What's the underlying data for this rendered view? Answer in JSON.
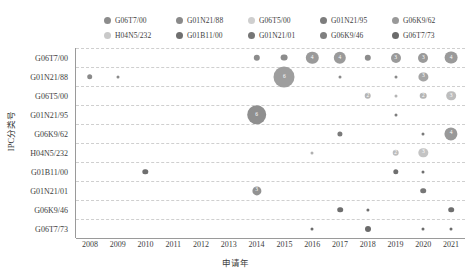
{
  "chart_data": {
    "type": "scatter",
    "title": "",
    "xlabel": "申请年",
    "ylabel": "IPC分类号",
    "x_categories": [
      "2008",
      "2009",
      "2010",
      "2011",
      "2012",
      "2013",
      "2014",
      "2015",
      "2016",
      "2017",
      "2018",
      "2019",
      "2020",
      "2021"
    ],
    "y_categories": [
      "G06T7/00",
      "G01N21/88",
      "G06T5/00",
      "G01N21/95",
      "G06K9/62",
      "H04N5/232",
      "G01B11/00",
      "G01N21/01",
      "G06K9/46",
      "G06T7/73"
    ],
    "grid": true,
    "legend_position": "top",
    "size_encodes": "count",
    "legend": [
      {
        "label": "G06T7/00",
        "color": "#8c8c8c"
      },
      {
        "label": "H04N5/232",
        "color": "#c9c9c9"
      },
      {
        "label": "G01N21/88",
        "color": "#8a8a8a"
      },
      {
        "label": "G01B11/00",
        "color": "#6f6f6f"
      },
      {
        "label": "G06T5/00",
        "color": "#cfcfcf"
      },
      {
        "label": "G01N21/01",
        "color": "#767676"
      },
      {
        "label": "G01N21/95",
        "color": "#7d7d7d"
      },
      {
        "label": "G06K9/46",
        "color": "#808080"
      },
      {
        "label": "G06K9/62",
        "color": "#999999"
      },
      {
        "label": "G06T7/73",
        "color": "#6b6b6b"
      }
    ],
    "points": [
      {
        "series": "G06T7/00",
        "x": "2014",
        "y": "G06T7/00",
        "value": 2,
        "color": "#8c8c8c",
        "r": 3.2,
        "show_label": false
      },
      {
        "series": "G06T7/00",
        "x": "2015",
        "y": "G06T7/00",
        "value": 2,
        "color": "#8c8c8c",
        "r": 3.4,
        "show_label": false
      },
      {
        "series": "G06T7/00",
        "x": "2016",
        "y": "G06T7/00",
        "value": 4,
        "color": "#9a9a9a",
        "r": 6.2,
        "show_label": true
      },
      {
        "series": "G06T7/00",
        "x": "2017",
        "y": "G06T7/00",
        "value": 4,
        "color": "#9a9a9a",
        "r": 6.2,
        "show_label": true
      },
      {
        "series": "G06T7/00",
        "x": "2018",
        "y": "G06T7/00",
        "value": 2,
        "color": "#8c8c8c",
        "r": 3.2,
        "show_label": false
      },
      {
        "series": "G06T7/00",
        "x": "2019",
        "y": "G06T7/00",
        "value": 3,
        "color": "#9a9a9a",
        "r": 5.0,
        "show_label": true
      },
      {
        "series": "G06T7/00",
        "x": "2020",
        "y": "G06T7/00",
        "value": 3,
        "color": "#9a9a9a",
        "r": 5.0,
        "show_label": true
      },
      {
        "series": "G06T7/00",
        "x": "2021",
        "y": "G06T7/00",
        "value": 4,
        "color": "#9a9a9a",
        "r": 6.4,
        "show_label": true
      },
      {
        "series": "G01N21/88",
        "x": "2008",
        "y": "G01N21/88",
        "value": 2,
        "color": "#8a8a8a",
        "r": 2.8,
        "show_label": false
      },
      {
        "series": "G01N21/88",
        "x": "2009",
        "y": "G01N21/88",
        "value": 1,
        "color": "#8a8a8a",
        "r": 1.5,
        "show_label": false
      },
      {
        "series": "G01N21/88",
        "x": "2015",
        "y": "G01N21/88",
        "value": 6,
        "color": "#9e9e9e",
        "r": 10.5,
        "show_label": true
      },
      {
        "series": "G01N21/88",
        "x": "2017",
        "y": "G01N21/88",
        "value": 1,
        "color": "#8a8a8a",
        "r": 1.5,
        "show_label": false
      },
      {
        "series": "G01N21/88",
        "x": "2019",
        "y": "G01N21/88",
        "value": 1,
        "color": "#8a8a8a",
        "r": 1.5,
        "show_label": false
      },
      {
        "series": "G01N21/88",
        "x": "2020",
        "y": "G01N21/88",
        "value": 3,
        "color": "#a5a5a5",
        "r": 4.6,
        "show_label": true
      },
      {
        "series": "G06T5/00",
        "x": "2018",
        "y": "G06T5/00",
        "value": 2,
        "color": "#b5b5b5",
        "r": 3.3,
        "show_label": true
      },
      {
        "series": "G06T5/00",
        "x": "2019",
        "y": "G06T5/00",
        "value": 1,
        "color": "#b5b5b5",
        "r": 1.5,
        "show_label": false
      },
      {
        "series": "G06T5/00",
        "x": "2020",
        "y": "G06T5/00",
        "value": 2,
        "color": "#b5b5b5",
        "r": 3.3,
        "show_label": true
      },
      {
        "series": "G06T5/00",
        "x": "2021",
        "y": "G06T5/00",
        "value": 3,
        "color": "#bdbdbd",
        "r": 4.8,
        "show_label": true
      },
      {
        "series": "G01N21/95",
        "x": "2014",
        "y": "G01N21/95",
        "value": 6,
        "color": "#8f8f8f",
        "r": 9.8,
        "show_label": true
      },
      {
        "series": "G01N21/95",
        "x": "2019",
        "y": "G01N21/95",
        "value": 1,
        "color": "#7d7d7d",
        "r": 1.5,
        "show_label": false
      },
      {
        "series": "G06K9/62",
        "x": "2017",
        "y": "G06K9/62",
        "value": 2,
        "color": "#7a7a7a",
        "r": 2.6,
        "show_label": false
      },
      {
        "series": "G06K9/62",
        "x": "2020",
        "y": "G06K9/62",
        "value": 1,
        "color": "#7a7a7a",
        "r": 1.5,
        "show_label": false
      },
      {
        "series": "G06K9/62",
        "x": "2021",
        "y": "G06K9/62",
        "value": 4,
        "color": "#999999",
        "r": 6.6,
        "show_label": true
      },
      {
        "series": "H04N5/232",
        "x": "2016",
        "y": "H04N5/232",
        "value": 1,
        "color": "#b0b0b0",
        "r": 1.5,
        "show_label": false
      },
      {
        "series": "H04N5/232",
        "x": "2019",
        "y": "H04N5/232",
        "value": 2,
        "color": "#bdbdbd",
        "r": 3.3,
        "show_label": true
      },
      {
        "series": "H04N5/232",
        "x": "2020",
        "y": "H04N5/232",
        "value": 3,
        "color": "#c4c4c4",
        "r": 4.7,
        "show_label": true
      },
      {
        "series": "G01B11/00",
        "x": "2010",
        "y": "G01B11/00",
        "value": 2,
        "color": "#6f6f6f",
        "r": 2.7,
        "show_label": false
      },
      {
        "series": "G01B11/00",
        "x": "2019",
        "y": "G01B11/00",
        "value": 2,
        "color": "#6f6f6f",
        "r": 2.7,
        "show_label": false
      },
      {
        "series": "G01B11/00",
        "x": "2020",
        "y": "G01B11/00",
        "value": 1,
        "color": "#6f6f6f",
        "r": 1.5,
        "show_label": false
      },
      {
        "series": "G01N21/01",
        "x": "2014",
        "y": "G01N21/01",
        "value": 3,
        "color": "#929292",
        "r": 4.6,
        "show_label": true
      },
      {
        "series": "G01N21/01",
        "x": "2020",
        "y": "G01N21/01",
        "value": 2,
        "color": "#767676",
        "r": 2.8,
        "show_label": false
      },
      {
        "series": "G06K9/46",
        "x": "2017",
        "y": "G06K9/46",
        "value": 2,
        "color": "#6e6e6e",
        "r": 2.8,
        "show_label": false
      },
      {
        "series": "G06K9/46",
        "x": "2018",
        "y": "G06K9/46",
        "value": 1,
        "color": "#6e6e6e",
        "r": 1.6,
        "show_label": false
      },
      {
        "series": "G06K9/46",
        "x": "2021",
        "y": "G06K9/46",
        "value": 2,
        "color": "#6e6e6e",
        "r": 2.8,
        "show_label": false
      },
      {
        "series": "G06T7/73",
        "x": "2016",
        "y": "G06T7/73",
        "value": 1,
        "color": "#6b6b6b",
        "r": 1.5,
        "show_label": false
      },
      {
        "series": "G06T7/73",
        "x": "2018",
        "y": "G06T7/73",
        "value": 2,
        "color": "#6b6b6b",
        "r": 3.0,
        "show_label": false
      },
      {
        "series": "G06T7/73",
        "x": "2020",
        "y": "G06T7/73",
        "value": 1,
        "color": "#6b6b6b",
        "r": 1.5,
        "show_label": false
      },
      {
        "series": "G06T7/73",
        "x": "2021",
        "y": "G06T7/73",
        "value": 1,
        "color": "#6b6b6b",
        "r": 1.5,
        "show_label": false
      }
    ]
  }
}
